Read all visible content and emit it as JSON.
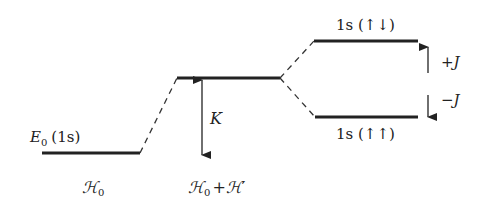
{
  "diagram": {
    "type": "energy-level-diagram",
    "colors": {
      "ink": "#222222",
      "background": "#ffffff"
    },
    "levels": [
      {
        "id": "ground",
        "label_main": "E",
        "label_sub": "0",
        "label_rest": "(1s)"
      },
      {
        "id": "perturbed"
      },
      {
        "id": "singlet",
        "label": "1s (↑↓)"
      },
      {
        "id": "triplet",
        "label": "1s (↑↑)"
      }
    ],
    "arrows": {
      "coulomb": {
        "label": "K"
      },
      "exchange_up": {
        "label": "+J"
      },
      "exchange_down": {
        "label": "−J"
      }
    },
    "columns": {
      "unperturbed": {
        "label": "ℋ",
        "sub": "0"
      },
      "perturbed": {
        "label_a": "ℋ",
        "sub": "0",
        "plus": "+",
        "label_b": "ℋ",
        "prime": "′"
      }
    }
  }
}
